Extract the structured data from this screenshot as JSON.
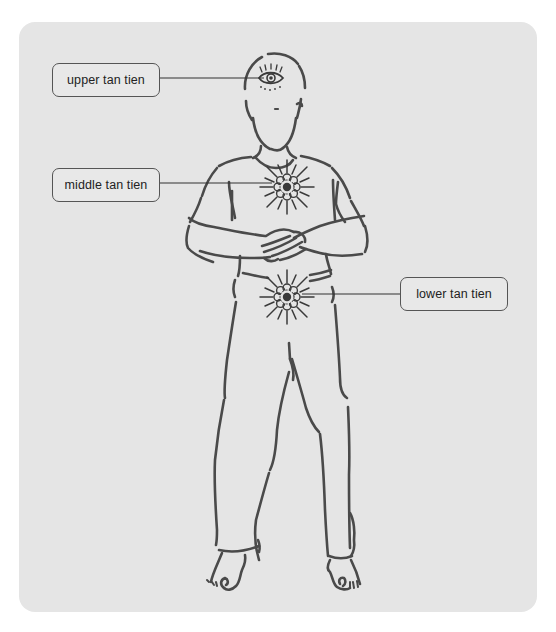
{
  "diagram": {
    "labels": [
      {
        "id": "upper",
        "text": "upper tan tien",
        "points_to": "third eye on forehead"
      },
      {
        "id": "middle",
        "text": "middle tan tien",
        "points_to": "center of chest"
      },
      {
        "id": "lower",
        "text": "lower tan tien",
        "points_to": "lower abdomen below navel"
      }
    ],
    "colors": {
      "panel_background": "#e5e5e5",
      "stroke": "#4a4a4a",
      "label_border": "#555555",
      "label_text": "#222222"
    }
  }
}
